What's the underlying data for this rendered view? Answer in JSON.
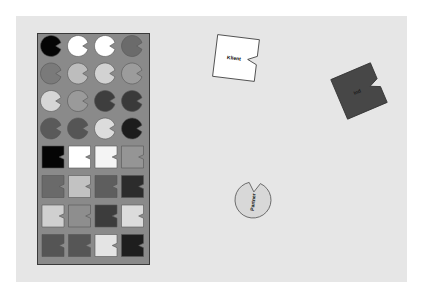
{
  "canvas": {
    "background": "#e6e6e6",
    "page": "#ffffff"
  },
  "palette": {
    "title": "shape-palette",
    "circles": [
      [
        "#050505",
        "#ffffff",
        "#ffffff",
        "#6b6b6b"
      ],
      [
        "#7a7a7a",
        "#bdbdbd",
        "#d2d2d2",
        "#9c9c9c"
      ],
      [
        "#d6d6d6",
        "#9a9a9a",
        "#3e3e3e",
        "#3a3a3a"
      ],
      [
        "#5a5a5a",
        "#555555",
        "#dcdcdc",
        "#1c1c1c"
      ]
    ],
    "squares": [
      [
        "#050505",
        "#ffffff",
        "#f4f4f4",
        "#959595"
      ],
      [
        "#6a6a6a",
        "#c2c2c2",
        "#5e5e5e",
        "#2c2c2c"
      ],
      [
        "#d0d0d0",
        "#8e8e8e",
        "#3c3c3c",
        "#dcdcdc"
      ],
      [
        "#555555",
        "#565656",
        "#e4e4e4",
        "#1e1e1e"
      ]
    ]
  },
  "canvas_shapes": [
    {
      "id": "klient",
      "shape": "square",
      "label": "Klient",
      "fill": "#ffffff",
      "text_color": "#000000",
      "cx": 236,
      "cy": 58,
      "size": 42,
      "rotation": 7
    },
    {
      "id": "dark",
      "shape": "square",
      "label": "Ind",
      "fill": "#474747",
      "text_color": "#1a1a1a",
      "cx": 359,
      "cy": 91,
      "size": 43,
      "rotation": -23
    },
    {
      "id": "partner",
      "shape": "circle",
      "label": "Partner",
      "fill": "#d8d8d8",
      "text_color": "#222222",
      "cx": 253,
      "cy": 200,
      "r": 18,
      "rotation": -84
    }
  ]
}
